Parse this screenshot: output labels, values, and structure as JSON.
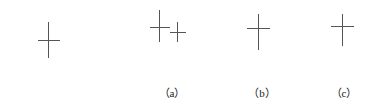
{
  "figure": {
    "title": "",
    "type": "candlestick-pattern-illustration",
    "background_color": "#ffffff",
    "line_color": "#555555",
    "bullish_body_color": "#ffffff",
    "bearish_body_color": "#111111",
    "border_color": "#444444",
    "groups": [
      {
        "id": "group-unlabeled",
        "caption": "",
        "x": 8,
        "width": 92,
        "elements": [
          {
            "kind": "candle",
            "name": "white-candle",
            "color": "white",
            "body_left": 12,
            "body_top": 48,
            "body_width": 14,
            "body_height": 47,
            "upper_wick": 0,
            "lower_wick": 0
          },
          {
            "kind": "doji",
            "name": "doji-cross",
            "center_x": 40,
            "top": 22,
            "bottom": 58,
            "bar_y": 40,
            "bar_left": 30,
            "bar_right": 52
          },
          {
            "kind": "candle",
            "name": "black-candle",
            "color": "black",
            "body_left": 60,
            "body_top": 52,
            "body_width": 14,
            "body_height": 43,
            "upper_wick": 0,
            "lower_wick": 0
          }
        ]
      },
      {
        "id": "group-a",
        "caption": "（a）",
        "x": 128,
        "width": 88,
        "elements": [
          {
            "kind": "candle",
            "name": "white-candle",
            "color": "white",
            "body_left": 4,
            "body_top": 30,
            "body_width": 14,
            "body_height": 40,
            "upper_wick": 0,
            "lower_wick": 0
          },
          {
            "kind": "doji",
            "name": "doji-cross-large",
            "center_x": 31,
            "top": 10,
            "bottom": 42,
            "bar_y": 27,
            "bar_left": 22,
            "bar_right": 42
          },
          {
            "kind": "doji",
            "name": "doji-cross-small",
            "center_x": 49,
            "top": 22,
            "bottom": 42,
            "bar_y": 32,
            "bar_left": 42,
            "bar_right": 58
          },
          {
            "kind": "candle",
            "name": "black-candle",
            "color": "black",
            "body_left": 62,
            "body_top": 30,
            "body_width": 14,
            "body_height": 41,
            "upper_wick": 0,
            "lower_wick": 0
          }
        ]
      },
      {
        "id": "group-b",
        "caption": "（b）",
        "x": 218,
        "width": 88,
        "elements": [
          {
            "kind": "candle",
            "name": "white-candle",
            "color": "white",
            "body_left": 7,
            "body_top": 32,
            "body_width": 14,
            "body_height": 38,
            "upper_wick": 19,
            "lower_wick": 0
          },
          {
            "kind": "doji",
            "name": "doji-cross",
            "center_x": 40,
            "top": 14,
            "bottom": 50,
            "bar_y": 28,
            "bar_left": 29,
            "bar_right": 52
          },
          {
            "kind": "candle",
            "name": "black-candle",
            "color": "black",
            "body_left": 60,
            "body_top": 32,
            "body_width": 14,
            "body_height": 38,
            "upper_wick": 19,
            "lower_wick": 0
          }
        ]
      },
      {
        "id": "group-c",
        "caption": "（c）",
        "x": 302,
        "width": 84,
        "elements": [
          {
            "kind": "candle",
            "name": "white-candle",
            "color": "white",
            "body_left": 7,
            "body_top": 30,
            "body_width": 14,
            "body_height": 38,
            "upper_wick": 16,
            "lower_wick": 12
          },
          {
            "kind": "doji",
            "name": "doji-cross",
            "center_x": 40,
            "top": 14,
            "bottom": 46,
            "bar_y": 26,
            "bar_left": 29,
            "bar_right": 52
          },
          {
            "kind": "candle",
            "name": "black-candle",
            "color": "black",
            "body_left": 60,
            "body_top": 30,
            "body_width": 14,
            "body_height": 38,
            "upper_wick": 16,
            "lower_wick": 12
          }
        ]
      }
    ],
    "caption_y": 84
  }
}
